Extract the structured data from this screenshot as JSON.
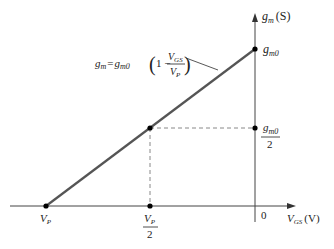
{
  "diagram": {
    "y_axis": {
      "symbol": "g",
      "sub": "m",
      "unit": "(S)"
    },
    "x_axis": {
      "symbol": "V",
      "sub": "GS",
      "unit": "(V)"
    },
    "origin_label": "0",
    "equation": {
      "lhs_symbol": "g",
      "lhs_sub": "m",
      "eq": "=",
      "rhs_symbol": "g",
      "rhs_sub": "m0",
      "open_paren": "(",
      "one_minus": "1 −",
      "num_symbol": "V",
      "num_sub": "GS",
      "den_symbol": "V",
      "den_sub": "P",
      "close_paren": ")"
    },
    "points": {
      "gm0": {
        "symbol": "g",
        "sub": "m0"
      },
      "gm0_half": {
        "num_symbol": "g",
        "num_sub": "m0",
        "den": "2"
      },
      "vp": {
        "symbol": "V",
        "sub": "P"
      },
      "vp_half": {
        "num_symbol": "V",
        "num_sub": "P",
        "den": "2"
      }
    },
    "colors": {
      "line": "#555555",
      "axis": "#444444",
      "dashed": "#888888",
      "dot": "#000000",
      "text": "#222222"
    }
  }
}
